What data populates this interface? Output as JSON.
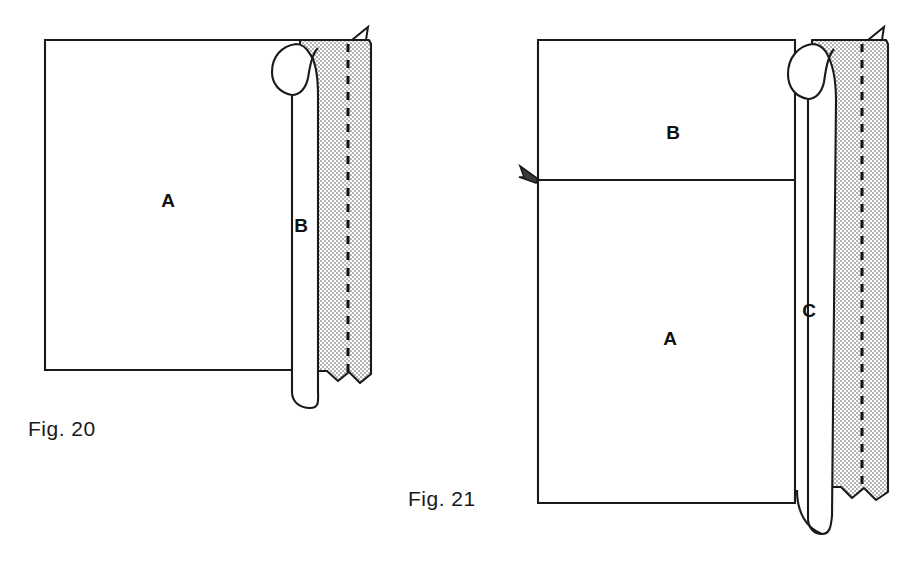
{
  "page": {
    "kind": "patent-figure-sheet",
    "background_color": "#ffffff",
    "ink_color": "#1a1a1a",
    "width": 919,
    "height": 587
  },
  "figures": [
    {
      "id": "fig-20",
      "caption": "Fig. 20",
      "caption_x": 28,
      "caption_y": 436,
      "description": "Rectangular fabric panel A with a rolled/folded hem at the right edge forming tube B, sewn with a dashed stitch line through a shaded fold-over flap.",
      "parts": [
        {
          "key": "A",
          "label": "A",
          "x": 168,
          "y": 207,
          "meaning": "main panel"
        },
        {
          "key": "B",
          "label": "B",
          "x": 301,
          "y": 232,
          "meaning": "rolled tube / casing"
        }
      ],
      "panel": {
        "left": 45,
        "top": 40,
        "right": 300,
        "bottom": 370
      },
      "shaded_flap": {
        "fill_color": "#d9d9d9",
        "left": 296,
        "right": 371,
        "top": 40,
        "bottom": 383
      },
      "stitch_line": {
        "x": 348,
        "top": 44,
        "bottom": 378,
        "style": "dashed"
      },
      "tube": {
        "left": 278,
        "right": 318,
        "top": 78,
        "bottom": 404
      },
      "corner_flag": {
        "x": 352,
        "y": 33,
        "points_to": "top-right"
      }
    },
    {
      "id": "fig-21",
      "caption": "Fig. 21",
      "caption_x": 408,
      "caption_y": 506,
      "description": "Two stacked fabric panels B (upper) and A (lower) joined by a horizontal seam marked with a small arrow flag; the right edge is rolled into tube C with a shaded fold-over flap and dashed stitch line.",
      "parts": [
        {
          "key": "B",
          "label": "B",
          "x": 673,
          "y": 139,
          "meaning": "upper panel"
        },
        {
          "key": "A",
          "label": "A",
          "x": 670,
          "y": 345,
          "meaning": "lower panel"
        },
        {
          "key": "C",
          "label": "C",
          "x": 809,
          "y": 317,
          "meaning": "rolled tube / casing"
        }
      ],
      "panel": {
        "left": 538,
        "top": 40,
        "right": 795,
        "bottom": 503
      },
      "seam_line": {
        "x1": 538,
        "x2": 795,
        "y": 180
      },
      "seam_flag": {
        "x": 527,
        "y": 172,
        "points_to": "left"
      },
      "shaded_flap": {
        "fill_color": "#d9d9d9",
        "left": 812,
        "right": 888,
        "top": 40,
        "bottom": 500
      },
      "stitch_line": {
        "x": 862,
        "top": 44,
        "bottom": 494,
        "style": "dashed"
      },
      "tube": {
        "left": 797,
        "right": 836,
        "top": 78,
        "bottom": 532
      },
      "corner_flag": {
        "x": 868,
        "y": 33,
        "points_to": "top-right"
      }
    }
  ],
  "colors": {
    "ink": "#1a1a1a",
    "shade_fill": "#d9d9d9",
    "paper": "#ffffff",
    "stitch": "#111111"
  }
}
